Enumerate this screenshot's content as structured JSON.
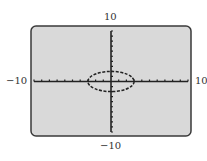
{
  "chart_data": {
    "type": "line",
    "title": "",
    "xlabel": "",
    "ylabel": "",
    "xlim": [
      -10,
      10
    ],
    "ylim": [
      -10,
      10
    ],
    "xscale_ticks": 1,
    "yscale_ticks": 1,
    "grid": false,
    "legend": null,
    "series": [
      {
        "name": "ellipse",
        "equation": "x^2/9 + y^2/4 = 1",
        "style": "dashed",
        "center": [
          0,
          0
        ],
        "semi_axis_x": 3,
        "semi_axis_y": 2
      }
    ],
    "window_labels": {
      "xmin": "−10",
      "xmax": "10",
      "ymin": "−10",
      "ymax": "10"
    }
  },
  "colors": {
    "screen_bg": "#d9d9d9",
    "frame": "#3a3a3a",
    "axis": "#222222",
    "curve": "#222222",
    "label": "#333333"
  }
}
